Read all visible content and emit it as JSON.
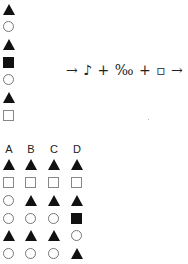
{
  "sequence": {
    "shapes": [
      "triangle",
      "circle",
      "triangle",
      "filled-square",
      "circle",
      "triangle",
      "open-square"
    ]
  },
  "formula": {
    "text": "→ ♪ + ‰ + ▫ →",
    "parts": [
      "arrow-right",
      "eighth-note",
      "plus",
      "per-mille",
      "plus",
      "open-square",
      "arrow-right"
    ]
  },
  "options": {
    "labels": [
      "A",
      "B",
      "C",
      "D"
    ],
    "columns": [
      [
        "triangle",
        "open-square",
        "circle",
        "circle",
        "triangle",
        "circle"
      ],
      [
        "triangle",
        "open-square",
        "triangle",
        "circle",
        "triangle",
        "circle"
      ],
      [
        "triangle",
        "open-square",
        "triangle",
        "circle",
        "triangle",
        "circle"
      ],
      [
        "triangle",
        "open-square",
        "triangle",
        "filled-square",
        "circle",
        "triangle"
      ]
    ]
  }
}
